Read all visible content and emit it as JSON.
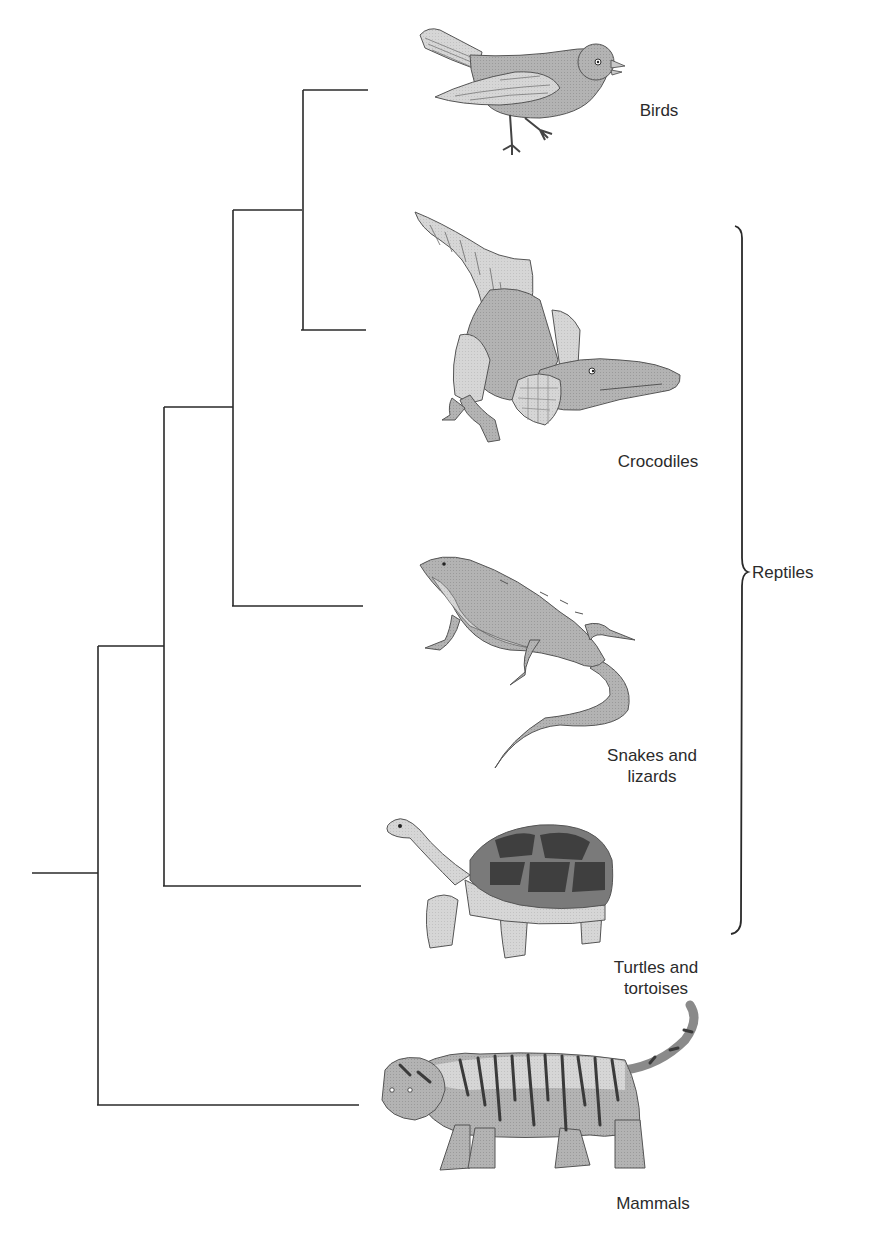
{
  "diagram": {
    "type": "phylogenetic-tree",
    "taxa": [
      {
        "id": "birds",
        "label": "Birds",
        "icon": "bird-icon"
      },
      {
        "id": "crocodiles",
        "label": "Crocodiles",
        "icon": "crocodile-icon"
      },
      {
        "id": "snakes_lizards",
        "label": "Snakes and\nlizards",
        "icon": "lizard-icon"
      },
      {
        "id": "turtles_tortoises",
        "label": "Turtles and\ntortoises",
        "icon": "tortoise-icon"
      },
      {
        "id": "mammals",
        "label": "Mammals",
        "icon": "tiger-icon"
      }
    ],
    "group_bracket": {
      "label": "Reptiles",
      "members": [
        "crocodiles",
        "snakes_lizards",
        "turtles_tortoises"
      ]
    },
    "topology": "(Mammals,(Turtles and tortoises,(Snakes and lizards,(Crocodiles,Birds))))",
    "colors": {
      "line": "#2a2a2a",
      "text": "#2b2b2b",
      "animal_fill_mid": "#a9a9a9",
      "animal_fill_light": "#d4d4d4",
      "animal_fill_dark": "#4a4a4a"
    }
  }
}
